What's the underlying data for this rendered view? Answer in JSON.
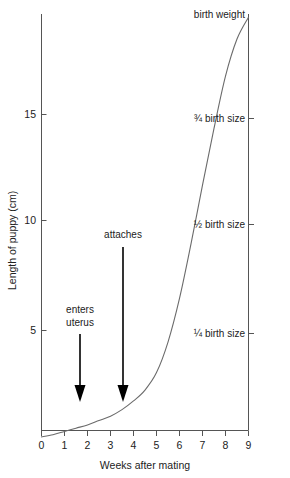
{
  "chart_data": {
    "type": "line",
    "title": "",
    "xlabel": "Weeks after mating",
    "ylabel": "Length of puppy (cm)",
    "xlim": [
      0,
      9
    ],
    "ylim": [
      0,
      19.5
    ],
    "grid": false,
    "legend": "none",
    "x_ticks": [
      0,
      1,
      2,
      3,
      4,
      5,
      6,
      7,
      8,
      9
    ],
    "x_tick_labels": [
      "0",
      "1",
      "2",
      "3",
      "4",
      "5",
      "6",
      "7",
      "8",
      "9"
    ],
    "y_ticks": [
      5,
      10,
      15
    ],
    "y_tick_labels": [
      "5",
      "10",
      "15"
    ],
    "series": [
      {
        "name": "Length of puppy",
        "x": [
          0,
          0.5,
          1,
          1.5,
          2,
          2.5,
          3,
          3.5,
          4,
          4.5,
          5,
          5.5,
          6,
          6.5,
          7,
          7.5,
          8,
          8.5,
          9
        ],
        "values": [
          0.05,
          0.15,
          0.3,
          0.45,
          0.6,
          0.8,
          1.0,
          1.3,
          1.7,
          2.2,
          3.0,
          4.4,
          6.4,
          8.9,
          11.6,
          14.2,
          16.6,
          18.3,
          19.3
        ]
      }
    ],
    "right_annotations": [
      {
        "label": "birth weight",
        "value": 19.3
      },
      {
        "label": "¾ birth size",
        "value": 14.7
      },
      {
        "label": "½ birth size",
        "value": 9.8
      },
      {
        "label": "¼ birth size",
        "value": 4.9
      }
    ],
    "arrow_annotations": [
      {
        "label": "enters uterus",
        "label_lines": [
          "enters",
          "uterus"
        ],
        "x": 1.4
      },
      {
        "label": "attaches",
        "label_lines": [
          "attaches"
        ],
        "x": 3.0
      }
    ]
  }
}
